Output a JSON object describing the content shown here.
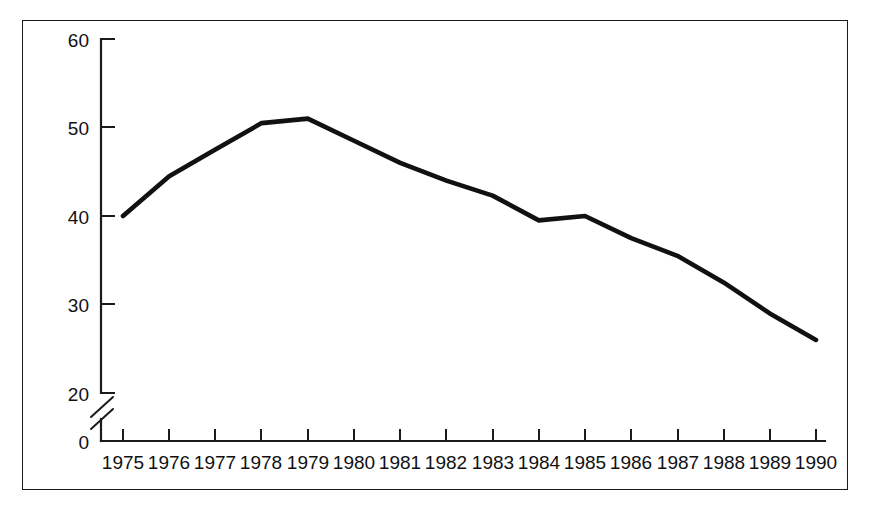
{
  "chart_data": {
    "type": "line",
    "title": "",
    "subtitle": "",
    "xlabel": "",
    "ylabel": "",
    "x": [
      1975,
      1976,
      1977,
      1978,
      1979,
      1980,
      1981,
      1982,
      1983,
      1984,
      1985,
      1986,
      1987,
      1988,
      1989,
      1990
    ],
    "categories": [
      "1975",
      "1976",
      "1977",
      "1978",
      "1979",
      "1980",
      "1981",
      "1982",
      "1983",
      "1984",
      "1985",
      "1986",
      "1987",
      "1988",
      "1989",
      "1990"
    ],
    "values": [
      40,
      44.5,
      47.5,
      50.5,
      51,
      48.5,
      46,
      44,
      42.3,
      39.5,
      40,
      37.5,
      35.5,
      32.5,
      29,
      26
    ],
    "series": [
      {
        "name": "series-1",
        "values": [
          40,
          44.5,
          47.5,
          50.5,
          51,
          48.5,
          46,
          44,
          42.3,
          39.5,
          40,
          37.5,
          35.5,
          32.5,
          29,
          26
        ],
        "color": "#111111"
      }
    ],
    "y_ticks": [
      0,
      20,
      30,
      40,
      50,
      60
    ],
    "y_tick_labels": [
      "0",
      "20",
      "30",
      "40",
      "50",
      "60"
    ],
    "ylim": [
      20,
      60
    ],
    "xlim": [
      1975,
      1990
    ],
    "axis_break": {
      "present": true,
      "between": [
        0,
        20
      ],
      "style": "double-slash"
    },
    "grid": false,
    "legend": null,
    "annotations": [],
    "line_color": "#111111",
    "axis_color": "#1b1b1b",
    "background_color": "#ffffff",
    "frame_color": "#1b1b1b"
  }
}
